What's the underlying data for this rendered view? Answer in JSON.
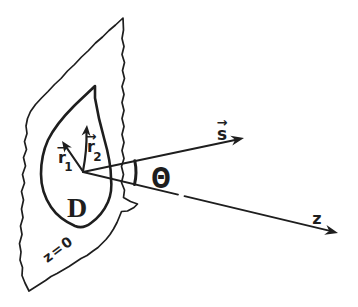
{
  "colors": {
    "ink": "#1e1e1e",
    "paper": "#ffffff"
  },
  "labels": {
    "region": "D",
    "angle": "Θ",
    "s_axis": "s",
    "z_axis": "z",
    "r1_base": "r",
    "r1_sub": "1",
    "r2_base": "r",
    "r2_sub": "2",
    "vector_accent": "→",
    "plane_equation": "z=0"
  }
}
